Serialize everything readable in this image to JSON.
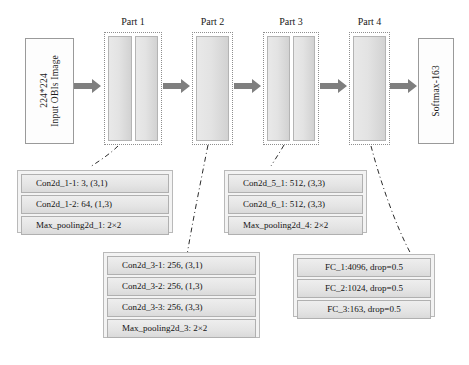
{
  "diagram": {
    "input_block": {
      "name": "input-block",
      "line1": "224*224",
      "line2": "Input OBIs Image"
    },
    "output_block": {
      "name": "output-block",
      "label": "Softmax-163"
    },
    "parts": [
      {
        "id": "part1",
        "label": "Part 1",
        "slabs": 2
      },
      {
        "id": "part2",
        "label": "Part 2",
        "slabs": 1
      },
      {
        "id": "part3",
        "label": "Part 3",
        "slabs": 2
      },
      {
        "id": "part4",
        "label": "Part 4",
        "slabs": 1
      }
    ],
    "detail_panels": [
      {
        "id": "panel-part1",
        "for_part": "Part 1",
        "rows": [
          "Con2d_1-1: 3, (3,1)",
          "Con2d_1-2: 64, (1,3)",
          "Max_pooling2d_1: 2×2"
        ]
      },
      {
        "id": "panel-part3",
        "for_part": "Part 3",
        "rows": [
          "Con2d_5_1: 512, (3,3)",
          "Con2d_6_1: 512, (3,3)",
          "Max_pooling2d_4: 2×2"
        ]
      },
      {
        "id": "panel-part2",
        "for_part": "Part 2",
        "rows": [
          "Con2d_3-1: 256, (3,1)",
          "Con2d_3-2: 256, (1,3)",
          "Con2d_3-3: 256, (3,3)",
          "Max_pooling2d_3: 2×2"
        ]
      },
      {
        "id": "panel-part4",
        "for_part": "Part 4",
        "rows": [
          "FC_1:4096, drop=0.5",
          "FC_2:1024, drop=0.5",
          "FC_3:163, drop=0.5"
        ]
      }
    ],
    "arrows": [
      {
        "id": "arrow-input-part1",
        "from": "input-block",
        "to": "part1"
      },
      {
        "id": "arrow-part1-part2",
        "from": "part1",
        "to": "part2"
      },
      {
        "id": "arrow-part2-part3",
        "from": "part2",
        "to": "part3"
      },
      {
        "id": "arrow-part3-part4",
        "from": "part3",
        "to": "part4"
      },
      {
        "id": "arrow-part4-output",
        "from": "part4",
        "to": "output-block"
      }
    ],
    "colors": {
      "arrow": "#7f7f7f",
      "slab_fill": "#e2e2e2",
      "panel_fill": "#f3f3f3",
      "row_fill": "#e6e6e6",
      "outline": "#8e8e8e",
      "connector": "#2b2b2b"
    }
  }
}
